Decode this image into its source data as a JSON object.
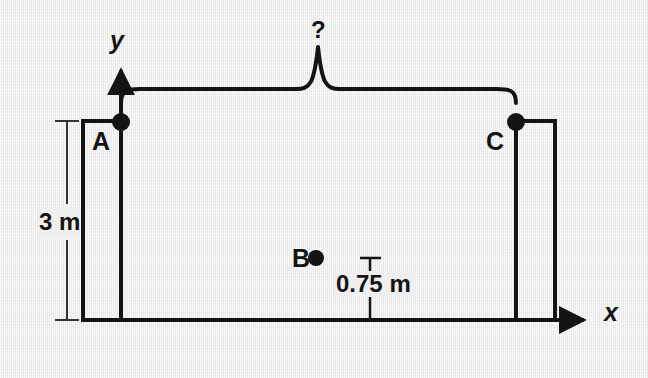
{
  "figure": {
    "type": "physics-mechanics-diagram",
    "background_color": "#efefef",
    "ink_color": "#141414",
    "axes": {
      "x_label": "x",
      "y_label": "y",
      "origin_label": "A",
      "x_axis": {
        "x1": 83,
        "y1": 320,
        "x2": 594,
        "y2": 320,
        "arrow": "right"
      },
      "y_axis": {
        "x1": 121,
        "y1": 320,
        "x2": 121,
        "y2": 62,
        "arrow": "up"
      }
    },
    "points": [
      {
        "name": "A",
        "label": "A",
        "x": 121,
        "y": 122,
        "label_x": 92,
        "label_y": 129
      },
      {
        "name": "B",
        "label": "B",
        "x": 316,
        "y": 258,
        "label_x": 292,
        "label_y": 246
      },
      {
        "name": "C",
        "label": "C",
        "x": 516,
        "y": 122,
        "label_x": 486,
        "label_y": 129
      }
    ],
    "blocks": [
      {
        "name": "left-block",
        "x": 83,
        "y": 121,
        "width": 38,
        "height": 199
      },
      {
        "name": "right-block",
        "x": 516,
        "y": 121,
        "width": 39,
        "height": 199
      }
    ],
    "dimensions": [
      {
        "name": "height-dimension",
        "value": "3 m",
        "orientation": "vertical",
        "line_x": 67,
        "y_top": 121,
        "y_bottom": 320,
        "tick_half_width": 12,
        "text_x": 38,
        "text_y": 208
      },
      {
        "name": "drop-dimension",
        "value": "0.75 m",
        "orientation": "vertical",
        "line_x": 370,
        "y_top": 258,
        "y_bottom": 320,
        "tick_half_width": 10,
        "text_x": 334,
        "text_y": 281
      }
    ],
    "brace": {
      "name": "span-brace",
      "label": "?",
      "left_x": 121,
      "right_x": 516,
      "base_y": 89,
      "peak_x": 318,
      "peak_y": 47,
      "label_x": 311,
      "label_y": 18
    }
  }
}
